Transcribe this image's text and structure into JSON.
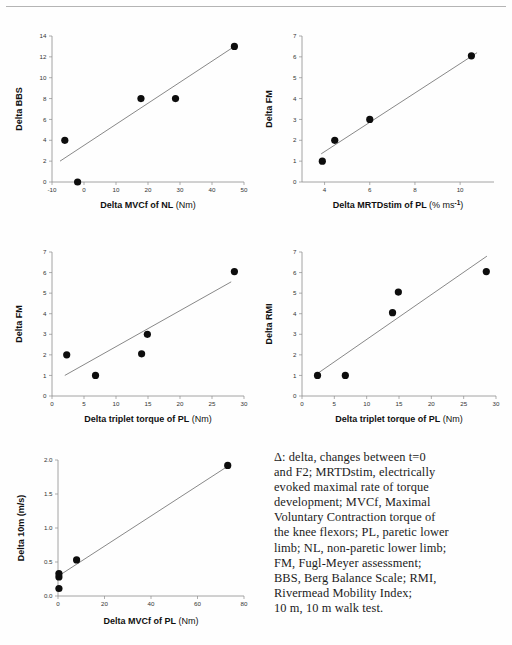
{
  "figure": {
    "top_rule": true,
    "caption_lines": [
      "Δ: delta, changes between t=0",
      "and F2; MRTDstim, electrically",
      "evoked maximal rate of torque",
      "development; MVCf, Maximal",
      "Voluntary Contraction torque of",
      "the knee flexors; PL, paretic lower",
      "limb; NL, non-paretic lower limb;",
      "FM, Fugl-Meyer assessment;",
      "BBS, Berg Balance Scale; RMI,",
      "Rivermead Mobility Index;",
      "10 m, 10 m walk test."
    ],
    "colors": {
      "marker": "#0d0d0d",
      "fit_line": "#7a7a7a",
      "axis": "#8d8d8d",
      "text": "#111111"
    }
  },
  "chart_data": [
    {
      "id": "panel-bbs-vs-mvcf-nl",
      "type": "scatter",
      "title": "",
      "xlabel": "Delta MVCf of NL (Nm)",
      "xlabel_name": "Delta MVCf of NL",
      "xlabel_unit": "(Nm)",
      "ylabel": "Delta BBS",
      "xlim": [
        -10,
        50
      ],
      "ylim": [
        0,
        14
      ],
      "xticks": [
        -10,
        0,
        10,
        20,
        30,
        40,
        50
      ],
      "xticklabels": [
        "-10",
        "0",
        "10",
        "20",
        "30",
        "40",
        "50"
      ],
      "yticks": [
        0,
        2,
        4,
        6,
        8,
        10,
        12,
        14
      ],
      "yticklabels": [
        "0",
        "2",
        "4",
        "6",
        "8",
        "10",
        "12",
        "14"
      ],
      "grid": false,
      "legend": "none",
      "points": [
        {
          "x": -6.0,
          "y": 4.0
        },
        {
          "x": -2.0,
          "y": 0.0
        },
        {
          "x": 17.8,
          "y": 8.0
        },
        {
          "x": 28.6,
          "y": 8.0
        },
        {
          "x": 47.0,
          "y": 13.0
        }
      ],
      "fit_line": {
        "x1": -7.5,
        "y1": 2.0,
        "x2": 47.5,
        "y2": 13.1
      }
    },
    {
      "id": "panel-fm-vs-mrtdstim-pl",
      "type": "scatter",
      "title": "",
      "xlabel": "Delta MRTDstim of PL (% ms-1)",
      "xlabel_name": "Delta MRTDstim of PL",
      "xlabel_unit": "(% ms",
      "xlabel_unit_sup": "-1",
      "xlabel_unit_tail": ")",
      "ylabel": "Delta FM",
      "xlim": [
        3,
        11.5
      ],
      "ylim": [
        0,
        7
      ],
      "xticks": [
        4,
        6,
        8,
        10
      ],
      "xticklabels": [
        "4",
        "6",
        "8",
        "10"
      ],
      "yticks": [
        0,
        1,
        2,
        3,
        4,
        5,
        6,
        7
      ],
      "yticklabels": [
        "0",
        "1",
        "2",
        "3",
        "4",
        "5",
        "6",
        "7"
      ],
      "grid": false,
      "legend": "none",
      "points": [
        {
          "x": 3.9,
          "y": 1.0
        },
        {
          "x": 4.45,
          "y": 2.0
        },
        {
          "x": 6.0,
          "y": 3.0
        },
        {
          "x": 10.5,
          "y": 6.05
        }
      ],
      "fit_line": {
        "x1": 3.85,
        "y1": 1.35,
        "x2": 10.75,
        "y2": 6.2
      }
    },
    {
      "id": "panel-fm-vs-triplet-pl",
      "type": "scatter",
      "title": "",
      "xlabel": "Delta triplet torque of PL (Nm)",
      "xlabel_name": "Delta triplet torque of PL",
      "xlabel_unit": "(Nm)",
      "ylabel": "Delta FM",
      "xlim": [
        0,
        30
      ],
      "ylim": [
        0,
        7
      ],
      "xticks": [
        0,
        5,
        10,
        15,
        20,
        25,
        30
      ],
      "xticklabels": [
        "0",
        "5",
        "10",
        "15",
        "20",
        "25",
        "30"
      ],
      "yticks": [
        0,
        1,
        2,
        3,
        4,
        5,
        6,
        7
      ],
      "yticklabels": [
        "0",
        "1",
        "2",
        "3",
        "4",
        "5",
        "6",
        "7"
      ],
      "grid": false,
      "legend": "none",
      "points": [
        {
          "x": 2.3,
          "y": 2.0
        },
        {
          "x": 6.8,
          "y": 1.0
        },
        {
          "x": 14.0,
          "y": 2.05
        },
        {
          "x": 14.9,
          "y": 3.0
        },
        {
          "x": 28.5,
          "y": 6.05
        }
      ],
      "fit_line": {
        "x1": 2.0,
        "y1": 1.0,
        "x2": 28.0,
        "y2": 5.55
      }
    },
    {
      "id": "panel-rmi-vs-triplet-pl",
      "type": "scatter",
      "title": "",
      "xlabel": "Delta triplet torque of PL (Nm)",
      "xlabel_name": "Delta triplet torque of PL",
      "xlabel_unit": "(Nm)",
      "ylabel": "Delta RMI",
      "xlim": [
        0,
        30
      ],
      "ylim": [
        0,
        7
      ],
      "xticks": [
        0,
        5,
        10,
        15,
        20,
        25,
        30
      ],
      "xticklabels": [
        "0",
        "5",
        "10",
        "15",
        "20",
        "25",
        "30"
      ],
      "yticks": [
        0,
        1,
        2,
        3,
        4,
        5,
        6,
        7
      ],
      "yticklabels": [
        "0",
        "1",
        "2",
        "3",
        "4",
        "5",
        "6",
        "7"
      ],
      "grid": false,
      "legend": "none",
      "points": [
        {
          "x": 2.4,
          "y": 1.0
        },
        {
          "x": 6.7,
          "y": 1.0
        },
        {
          "x": 14.0,
          "y": 4.05
        },
        {
          "x": 14.9,
          "y": 5.05
        },
        {
          "x": 28.5,
          "y": 6.05
        }
      ],
      "fit_line": {
        "x1": 2.2,
        "y1": 1.05,
        "x2": 28.6,
        "y2": 6.8
      }
    },
    {
      "id": "panel-10m-vs-mvcf-pl",
      "type": "scatter",
      "title": "",
      "xlabel": "Delta MVCf of PL (Nm)",
      "xlabel_name": "Delta MVCf of PL",
      "xlabel_unit": "(Nm)",
      "ylabel": "Delta 10m (m/s)",
      "xlim": [
        0,
        80
      ],
      "ylim": [
        0.0,
        2.0
      ],
      "xticks": [
        0,
        20,
        40,
        60,
        80
      ],
      "xticklabels": [
        "0",
        "20",
        "40",
        "60",
        "80"
      ],
      "yticks": [
        0.0,
        0.5,
        1.0,
        1.5,
        2.0
      ],
      "yticklabels": [
        "0.0",
        "0.5",
        "1.0",
        "1.5",
        "2.0"
      ],
      "grid": false,
      "legend": "none",
      "points": [
        {
          "x": 0.4,
          "y": 0.11
        },
        {
          "x": 0.4,
          "y": 0.28
        },
        {
          "x": 0.4,
          "y": 0.33
        },
        {
          "x": 8.0,
          "y": 0.53
        },
        {
          "x": 73.0,
          "y": 1.92
        }
      ],
      "fit_line": {
        "x1": 0.0,
        "y1": 0.29,
        "x2": 74.0,
        "y2": 1.93
      }
    }
  ]
}
